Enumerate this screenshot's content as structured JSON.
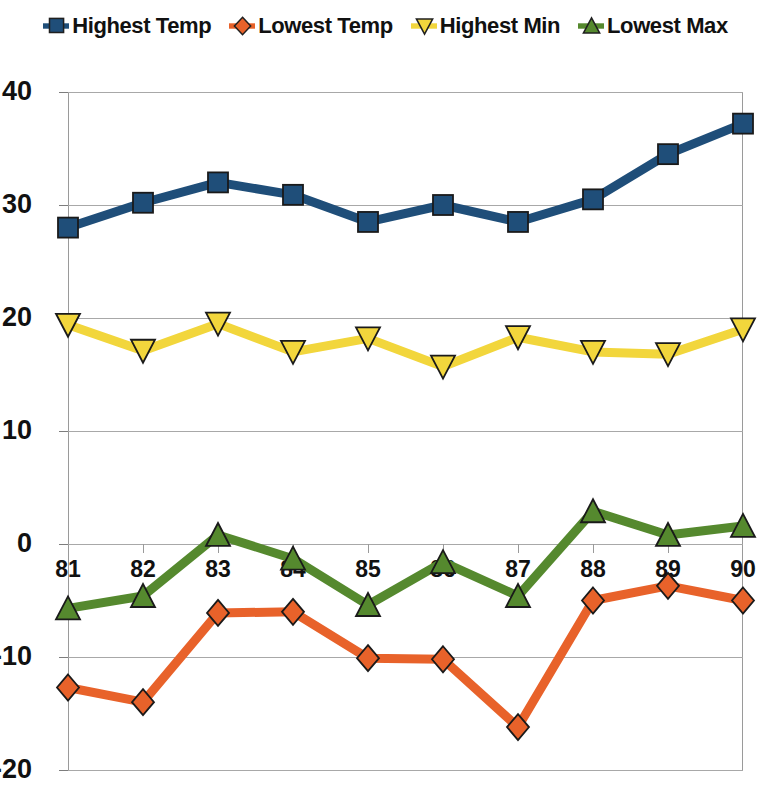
{
  "legend": {
    "position": "top-center",
    "items": [
      {
        "label": "Highest Temp",
        "color": "#1F4E79",
        "marker": "square",
        "marker_icon": "legend-square-marker-icon"
      },
      {
        "label": "Lowest Temp",
        "color": "#E8622A",
        "marker": "diamond",
        "marker_icon": "legend-diamond-marker-icon"
      },
      {
        "label": "Highest Min",
        "color": "#F2D63C",
        "marker": "triangle-down",
        "marker_icon": "legend-triangle-down-marker-icon"
      },
      {
        "label": "Lowest Max",
        "color": "#55892E",
        "marker": "triangle-up",
        "marker_icon": "legend-triangle-up-marker-icon"
      }
    ]
  },
  "axes": {
    "y_ticks": [
      "40",
      "30",
      "20",
      "10",
      "0",
      "-10",
      "-20"
    ],
    "x_ticks": [
      "81",
      "82",
      "83",
      "84",
      "85",
      "86",
      "87",
      "88",
      "89",
      "90"
    ]
  },
  "chart_data": {
    "type": "line",
    "title": "",
    "subtitle": "",
    "xlabel": "",
    "ylabel": "",
    "x": [
      81,
      82,
      83,
      84,
      85,
      86,
      87,
      88,
      89,
      90
    ],
    "categories": [
      "81",
      "82",
      "83",
      "84",
      "85",
      "86",
      "87",
      "88",
      "89",
      "90"
    ],
    "ylim": [
      -20,
      40
    ],
    "ytick_values": [
      40,
      30,
      20,
      10,
      0,
      -10,
      -20
    ],
    "grid": "horizontal",
    "legend_position": "top-center",
    "series": [
      {
        "name": "Highest Temp",
        "color": "#1F4E79",
        "marker": "square",
        "values": [
          28.0,
          30.2,
          32.0,
          30.9,
          28.5,
          30.0,
          28.5,
          30.5,
          34.5,
          37.2
        ]
      },
      {
        "name": "Lowest Temp",
        "color": "#E8622A",
        "marker": "diamond",
        "values": [
          -12.7,
          -14.0,
          -6.1,
          -6.0,
          -10.1,
          -10.2,
          -16.2,
          -5.0,
          -3.7,
          -5.0
        ]
      },
      {
        "name": "Highest Min",
        "color": "#F2D63C",
        "marker": "triangle-down",
        "values": [
          19.4,
          17.1,
          19.5,
          17.0,
          18.2,
          15.7,
          18.3,
          17.0,
          16.8,
          19.0
        ]
      },
      {
        "name": "Lowest Max",
        "color": "#55892E",
        "marker": "triangle-up",
        "values": [
          -5.7,
          -4.6,
          0.8,
          -1.3,
          -5.4,
          -1.6,
          -4.6,
          2.9,
          0.8,
          1.6
        ]
      }
    ]
  }
}
